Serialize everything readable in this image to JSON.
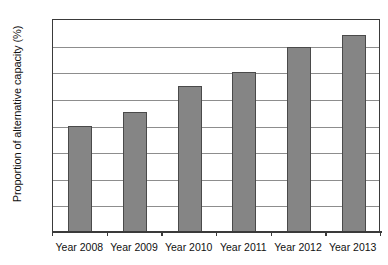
{
  "chart_data": {
    "type": "bar",
    "title": "",
    "subtitle": "",
    "xlabel": "",
    "ylabel": "Proportion of alternative capacity (%)",
    "categories": [
      "Year 2008",
      "Year 2009",
      "Year 2010",
      "Year 2011",
      "Year 2012",
      "Year 2013"
    ],
    "values": [
      8.0,
      9.0,
      11.0,
      12.0,
      13.9,
      14.8
    ],
    "series": [
      {
        "name": "Proportion of alternative capacity",
        "values": [
          8.0,
          9.0,
          11.0,
          12.0,
          13.9,
          14.8
        ]
      }
    ],
    "ylim": [
      0,
      16
    ],
    "xlim": [
      0,
      6
    ],
    "ytick_labels": [
      "0",
      "2",
      "4",
      "6",
      "8",
      "10",
      "12",
      "14",
      "16"
    ],
    "ytick_values": [
      0,
      2,
      4,
      6,
      8,
      10,
      12,
      14,
      16
    ],
    "grid": true,
    "grid_axis": "y",
    "legend": false,
    "legend_position": "none",
    "annotations": [],
    "colors": {
      "bar_fill": "#858585",
      "bar_edge": "#4a4a4a",
      "gridline": "#8d8d8d",
      "axis": "#3a3a3a",
      "background": "#ffffff",
      "text": "#111111"
    }
  }
}
